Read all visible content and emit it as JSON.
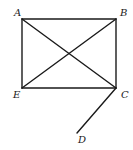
{
  "diagram": {
    "type": "geometry",
    "points": {
      "A": {
        "label": "A",
        "x": 22,
        "y": 19,
        "label_x": 14,
        "label_y": 16
      },
      "B": {
        "label": "B",
        "x": 116,
        "y": 19,
        "label_x": 120,
        "label_y": 16
      },
      "C": {
        "label": "C",
        "x": 116,
        "y": 88,
        "label_x": 121,
        "label_y": 98
      },
      "D": {
        "label": "D",
        "x": 77,
        "y": 133,
        "label_x": 78,
        "label_y": 143
      },
      "E": {
        "label": "E",
        "x": 22,
        "y": 88,
        "label_x": 13,
        "label_y": 98
      }
    },
    "segments": [
      [
        "A",
        "B"
      ],
      [
        "B",
        "C"
      ],
      [
        "C",
        "E"
      ],
      [
        "E",
        "A"
      ],
      [
        "A",
        "C"
      ],
      [
        "B",
        "E"
      ],
      [
        "C",
        "D"
      ]
    ]
  }
}
